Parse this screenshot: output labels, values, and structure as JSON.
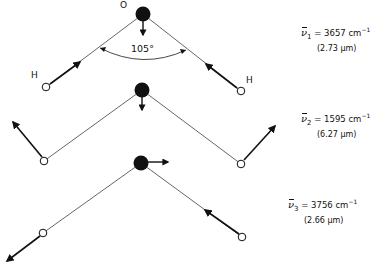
{
  "figure": {
    "atom_labels": {
      "oxygen": "O",
      "hydrogen_left": "H",
      "hydrogen_right": "H"
    },
    "bond_angle": "105°",
    "colors": {
      "ink": "#111111",
      "bond": "#555555",
      "background": "#ffffff"
    }
  },
  "modes": [
    {
      "symbol": "ν",
      "index": "1",
      "equals": "=",
      "wavenumber": "3657",
      "unit": "cm",
      "unit_exp": "−1",
      "wavelength": "(2.73 μm)",
      "type": "symmetric stretch"
    },
    {
      "symbol": "ν",
      "index": "2",
      "equals": "=",
      "wavenumber": "1595",
      "unit": "cm",
      "unit_exp": "−1",
      "wavelength": "(6.27 μm)",
      "type": "bend"
    },
    {
      "symbol": "ν",
      "index": "3",
      "equals": "=",
      "wavenumber": "3756",
      "unit": "cm",
      "unit_exp": "−1",
      "wavelength": "(2.66 μm)",
      "type": "asymmetric stretch"
    }
  ]
}
